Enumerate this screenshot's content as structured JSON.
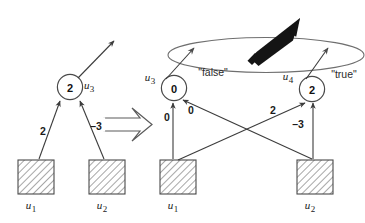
{
  "figure": {
    "transform_arrow": {
      "icon": "hollow-right-arrow",
      "direction": "right"
    },
    "palette": {
      "stroke": "#3c3c3c",
      "hatch": "#7a7a7a",
      "text": "#1a1a1a",
      "thick_arrow": "#111111",
      "ellipse": "#6b6b6b",
      "background": "#ffffff"
    }
  },
  "left_graph": {
    "name": "before",
    "nodes": [
      {
        "id": "u3",
        "value": "2",
        "label": "u",
        "subscript": "3",
        "shape": "circle"
      }
    ],
    "inputs": [
      {
        "id": "u1",
        "label": "u",
        "subscript": "1",
        "shape": "hatched-square"
      },
      {
        "id": "u2",
        "label": "u",
        "subscript": "2",
        "shape": "hatched-square"
      }
    ],
    "edges": [
      {
        "from": "u1",
        "to": "u3",
        "weight": "2"
      },
      {
        "from": "u2",
        "to": "u3",
        "weight": "–3"
      }
    ],
    "output_edge": {
      "from": "u3",
      "to": "outside",
      "arrow": "up-right"
    }
  },
  "right_graph": {
    "name": "after",
    "nodes": [
      {
        "id": "u3",
        "value": "0",
        "label": "u",
        "subscript": "3",
        "shape": "circle",
        "branch": "\"false\""
      },
      {
        "id": "u4",
        "value": "2",
        "label": "u",
        "subscript": "4",
        "shape": "circle",
        "branch": "\"true\""
      }
    ],
    "inputs": [
      {
        "id": "u1",
        "label": "u",
        "subscript": "1",
        "shape": "hatched-square"
      },
      {
        "id": "u2",
        "label": "u",
        "subscript": "2",
        "shape": "hatched-square"
      }
    ],
    "edges": [
      {
        "from": "u1",
        "to": "u3",
        "weight": "0"
      },
      {
        "from": "u2",
        "to": "u3",
        "weight": "0"
      },
      {
        "from": "u1",
        "to": "u4",
        "weight": "2"
      },
      {
        "from": "u2",
        "to": "u4",
        "weight": "–3"
      }
    ],
    "branch_labels": {
      "false": "\"false\"",
      "true": "\"true\""
    },
    "grouping": {
      "shape": "ellipse",
      "marker": "thick-black-arrow",
      "marker_direction": "up-right"
    }
  }
}
